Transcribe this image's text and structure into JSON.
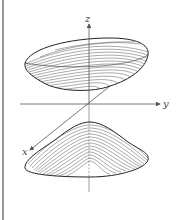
{
  "figure": {
    "axes": {
      "x_label": "x",
      "y_label": "y",
      "z_label": "z"
    },
    "colors": {
      "background": "#ffffff",
      "surface_lines": "#333333",
      "axes": "#555555",
      "frame_line": "#9a9a9a"
    }
  }
}
